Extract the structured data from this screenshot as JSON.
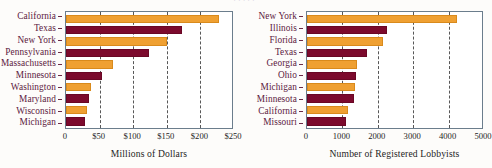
{
  "figure": {
    "cropped_header_fragment": "·  ·   ·     ·      ·"
  },
  "chart_data": [
    {
      "type": "bar",
      "orientation": "horizontal",
      "panel": "left",
      "title": "",
      "xlabel": "Millions of Dollars",
      "ylabel": "",
      "categories": [
        "California",
        "Texas",
        "New York",
        "Pennsylvania",
        "Massachusetts",
        "Minnesota",
        "Washington",
        "Maryland",
        "Wisconsin",
        "Michigan"
      ],
      "values": [
        228,
        173,
        150,
        124,
        70,
        54,
        37,
        34,
        31,
        29
      ],
      "xlim": [
        0,
        250
      ],
      "xticks": [
        0,
        50,
        100,
        150,
        200,
        250
      ],
      "xticklabels": [
        "0",
        "$50",
        "$100",
        "$150",
        "$200",
        "$250"
      ],
      "grid": "vertical-dashed",
      "legend": "none",
      "colors": {
        "odd": "#efa032",
        "even": "#7c0a2d"
      }
    },
    {
      "type": "bar",
      "orientation": "horizontal",
      "panel": "right",
      "title": "",
      "xlabel": "Number of Registered Lobbyists",
      "ylabel": "",
      "categories": [
        "New York",
        "Illinois",
        "Florida",
        "Texas",
        "Georgia",
        "Ohio",
        "Michigan",
        "Minnesota",
        "California",
        "Missouri"
      ],
      "values": [
        4250,
        2250,
        2150,
        1700,
        1400,
        1380,
        1350,
        1320,
        1150,
        1100
      ],
      "xlim": [
        0,
        5000
      ],
      "xticks": [
        0,
        1000,
        2000,
        3000,
        4000,
        5000
      ],
      "xticklabels": [
        "0",
        "1000",
        "2000",
        "3000",
        "4000",
        "5000"
      ],
      "grid": "vertical-dashed",
      "legend": "none",
      "colors": {
        "odd": "#efa032",
        "even": "#7c0a2d"
      }
    }
  ]
}
